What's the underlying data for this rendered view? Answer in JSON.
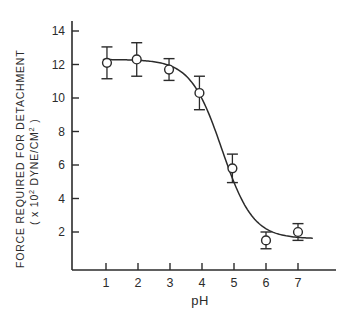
{
  "figure": {
    "background_color": "#ffffff",
    "ink_color": "#2b2b2b"
  },
  "chart_data": {
    "type": "line",
    "title": "",
    "subtitle": "",
    "xlabel": "pH",
    "ylabel_line1": "FORCE  REQUIRED  FOR  DETACHMENT",
    "ylabel_line2_prefix": "( x 10",
    "ylabel_line2_exp": "2",
    "ylabel_line2_mid": " DYNE/CM",
    "ylabel_line2_exp2": "2",
    "ylabel_line2_suffix": " )",
    "x": [
      1,
      2,
      3,
      4,
      5,
      6,
      7
    ],
    "xticklabels": [
      "1",
      "2",
      "3",
      "4",
      "5",
      "6",
      "7"
    ],
    "yticklabels": [
      "2",
      "4",
      "6",
      "8",
      "10",
      "12",
      "14"
    ],
    "yticks": [
      2,
      4,
      6,
      8,
      10,
      12,
      14
    ],
    "xlim": [
      0.45,
      7.75
    ],
    "ylim": [
      0,
      14
    ],
    "grid": false,
    "legend": null,
    "marker": "open-circle",
    "series": [
      {
        "name": "Force required for detachment",
        "values": [
          12.1,
          12.3,
          11.7,
          10.3,
          5.8,
          1.5,
          2.0
        ],
        "errors": [
          0.95,
          1.0,
          0.65,
          1.0,
          0.85,
          0.5,
          0.5
        ],
        "x_offsets": [
          0.03,
          -0.04,
          -0.03,
          -0.08,
          -0.05,
          0.0,
          0.0
        ]
      }
    ],
    "fit_curve": {
      "description": "sigmoidal decreasing curve",
      "upper_plateau": 12.3,
      "lower_plateau": 1.6,
      "midpoint_ph": 4.62,
      "slope": 2.05
    }
  }
}
